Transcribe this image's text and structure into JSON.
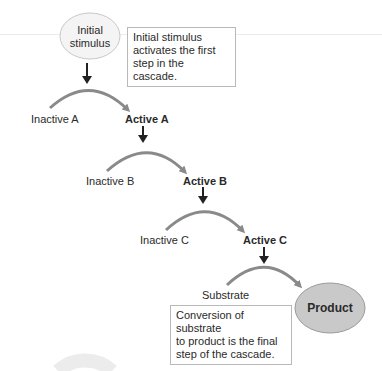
{
  "diagram": {
    "start_node": {
      "label_line1": "Initial",
      "label_line2": "stimulus"
    },
    "start_note": {
      "line1": "Initial stimulus",
      "line2": "activates the first",
      "line3": "step in the cascade."
    },
    "steps": [
      {
        "inactive": "Inactive A",
        "active": "Active A"
      },
      {
        "inactive": "Inactive B",
        "active": "Active B"
      },
      {
        "inactive": "Inactive C",
        "active": "Active C"
      }
    ],
    "final_step": {
      "substrate": "Substrate",
      "product": "Product"
    },
    "end_note": {
      "line1": "Conversion of substrate",
      "line2": "to product is the final",
      "line3": "step of the cascade."
    },
    "colors": {
      "arc": "#8a8a8a",
      "arrow": "#222222",
      "start_ellipse_fill": "#f4f4f4",
      "start_ellipse_stroke": "#c8c8c8",
      "product_fill": "#c9c9c9",
      "product_stroke": "#9a9a9a"
    }
  }
}
